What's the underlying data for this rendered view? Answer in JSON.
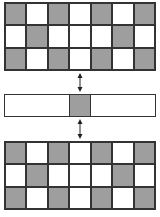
{
  "diagram": {
    "colors": {
      "gray": "#9e9e9e",
      "white": "#ffffff",
      "border": "#333333"
    },
    "top_grid": {
      "rows": [
        [
          "gray",
          "white",
          "gray",
          "white",
          "gray",
          "white",
          "gray"
        ],
        [
          "white",
          "gray",
          "white",
          "white",
          "white",
          "gray",
          "white"
        ],
        [
          "gray",
          "white",
          "gray",
          "white",
          "gray",
          "white",
          "gray"
        ]
      ]
    },
    "middle_strip": {
      "center_cell": "gray",
      "rest": "white"
    },
    "bottom_grid": {
      "rows": [
        [
          "gray",
          "white",
          "gray",
          "white",
          "gray",
          "white",
          "gray"
        ],
        [
          "white",
          "gray",
          "white",
          "white",
          "white",
          "gray",
          "white"
        ],
        [
          "gray",
          "white",
          "gray",
          "white",
          "gray",
          "white",
          "gray"
        ]
      ]
    },
    "arrows": [
      {
        "type": "double-headed",
        "from": "top_grid",
        "to": "middle_strip"
      },
      {
        "type": "double-headed",
        "from": "middle_strip",
        "to": "bottom_grid"
      }
    ]
  }
}
